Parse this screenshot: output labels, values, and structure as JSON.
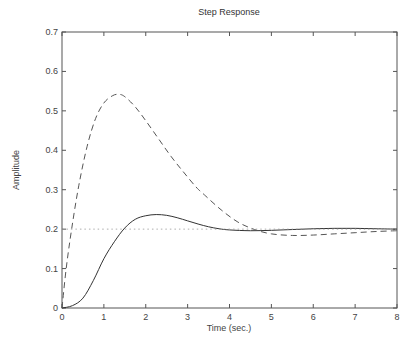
{
  "chart_data": {
    "type": "line",
    "title": "Step Response",
    "xlabel": "Time (sec.)",
    "ylabel": "Amplitude",
    "xlim": [
      0,
      8
    ],
    "ylim": [
      0,
      0.7
    ],
    "xticks": [
      0,
      1,
      2,
      3,
      4,
      5,
      6,
      7,
      8
    ],
    "xtick_labels": [
      "0",
      "1",
      "2",
      "3",
      "4",
      "5",
      "6",
      "7",
      "8"
    ],
    "yticks": [
      0,
      0.1,
      0.2,
      0.3,
      0.4,
      0.5,
      0.6,
      0.7
    ],
    "ytick_labels": [
      "0",
      "0.1",
      "0.2",
      "0.3",
      "0.4",
      "0.5",
      "0.6",
      "0.7"
    ],
    "grid": false,
    "legend": null,
    "series": [
      {
        "name": "solid response",
        "style": "solid",
        "color": "#333333",
        "x": [
          0,
          0.25,
          0.5,
          0.75,
          1.0,
          1.25,
          1.5,
          1.75,
          2.0,
          2.25,
          2.5,
          2.75,
          3.0,
          3.25,
          3.5,
          3.75,
          4.0,
          4.5,
          5.0,
          5.5,
          6.0,
          6.5,
          7.0,
          7.5,
          8.0
        ],
        "values": [
          0,
          0.006,
          0.025,
          0.07,
          0.125,
          0.168,
          0.203,
          0.225,
          0.234,
          0.237,
          0.235,
          0.229,
          0.221,
          0.213,
          0.206,
          0.201,
          0.198,
          0.196,
          0.197,
          0.199,
          0.201,
          0.202,
          0.202,
          0.201,
          0.2
        ]
      },
      {
        "name": "dashed response",
        "style": "dashed",
        "color": "#555555",
        "x": [
          0,
          0.1,
          0.23,
          0.4,
          0.6,
          0.8,
          1.0,
          1.2,
          1.35,
          1.5,
          1.75,
          2.0,
          2.3,
          2.6,
          2.9,
          3.2,
          3.4,
          3.8,
          4.2,
          4.6,
          5.0,
          5.5,
          6.0,
          6.5,
          7.0,
          7.5,
          8.0
        ],
        "values": [
          0,
          0.1,
          0.2,
          0.31,
          0.41,
          0.48,
          0.52,
          0.538,
          0.542,
          0.536,
          0.51,
          0.475,
          0.43,
          0.385,
          0.345,
          0.307,
          0.287,
          0.249,
          0.218,
          0.199,
          0.188,
          0.184,
          0.185,
          0.188,
          0.191,
          0.194,
          0.196
        ]
      },
      {
        "name": "steady-state reference",
        "style": "dotted",
        "color": "#999999",
        "x": [
          0,
          8
        ],
        "values": [
          0.2,
          0.2
        ]
      }
    ]
  }
}
